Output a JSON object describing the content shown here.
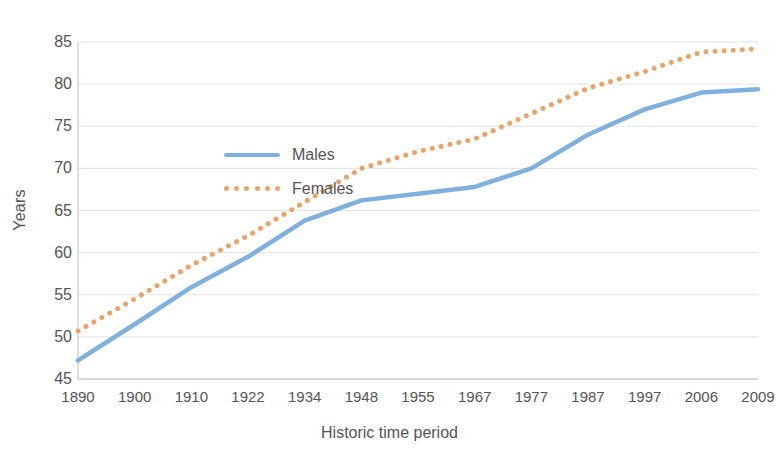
{
  "chart_data": {
    "type": "line",
    "title": "",
    "xlabel": "Historic time period",
    "ylabel": "Years",
    "categories": [
      "1890",
      "1900",
      "1910",
      "1922",
      "1934",
      "1948",
      "1955",
      "1967",
      "1977",
      "1987",
      "1997",
      "2006",
      "2009"
    ],
    "series": [
      {
        "name": "Males",
        "color": "#7FB0DE",
        "style": "solid",
        "values": [
          47.2,
          51.5,
          55.9,
          59.5,
          63.8,
          66.2,
          67.0,
          67.8,
          70.0,
          74.0,
          77.0,
          79.0,
          79.4
        ]
      },
      {
        "name": "Females",
        "color": "#E8A56A",
        "style": "dotted",
        "values": [
          50.7,
          54.5,
          58.5,
          62.0,
          66.0,
          70.0,
          72.0,
          73.5,
          76.5,
          79.5,
          81.5,
          83.8,
          84.2
        ]
      }
    ],
    "ylim": [
      45,
      85
    ],
    "ytick_step": 5,
    "yticks": [
      "85",
      "80",
      "75",
      "70",
      "65",
      "60",
      "55",
      "50",
      "45"
    ],
    "grid": true,
    "grid_color": "#E3E3E3",
    "legend_position": "inside-top-left",
    "axis_color": "#BFBFBF",
    "text_color": "#555555"
  }
}
